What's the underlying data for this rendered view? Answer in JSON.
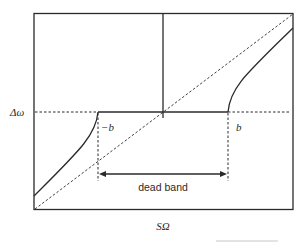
{
  "diagram": {
    "type": "dead-band characteristic",
    "y_axis_label": "Δω",
    "x_axis_label": "SΩ",
    "labels": {
      "neg_b": "−b",
      "pos_b": "b",
      "dead_band": "dead band"
    },
    "colors": {
      "line": "#2a2a2a",
      "frame": "#2a2a2a",
      "background": "#ffffff"
    }
  }
}
